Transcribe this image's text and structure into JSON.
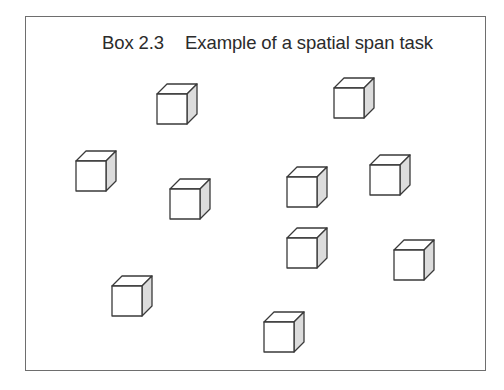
{
  "box": {
    "label": "Box 2.3",
    "title": "Example of a spatial span task"
  },
  "colors": {
    "border": "#6e6e6e",
    "cube_stroke": "#3a3a3a",
    "cube_front": "#ffffff",
    "cube_top": "#ffffff",
    "cube_side": "#dcdcdc"
  },
  "cubes": [
    {
      "x": 157,
      "y": 94,
      "size": 30
    },
    {
      "x": 334,
      "y": 88,
      "size": 30
    },
    {
      "x": 76,
      "y": 161,
      "size": 30
    },
    {
      "x": 170,
      "y": 189,
      "size": 30
    },
    {
      "x": 287,
      "y": 177,
      "size": 30
    },
    {
      "x": 370,
      "y": 165,
      "size": 30
    },
    {
      "x": 287,
      "y": 238,
      "size": 30
    },
    {
      "x": 394,
      "y": 250,
      "size": 30
    },
    {
      "x": 112,
      "y": 286,
      "size": 30
    },
    {
      "x": 264,
      "y": 322,
      "size": 30
    }
  ],
  "cube_depth": 10
}
